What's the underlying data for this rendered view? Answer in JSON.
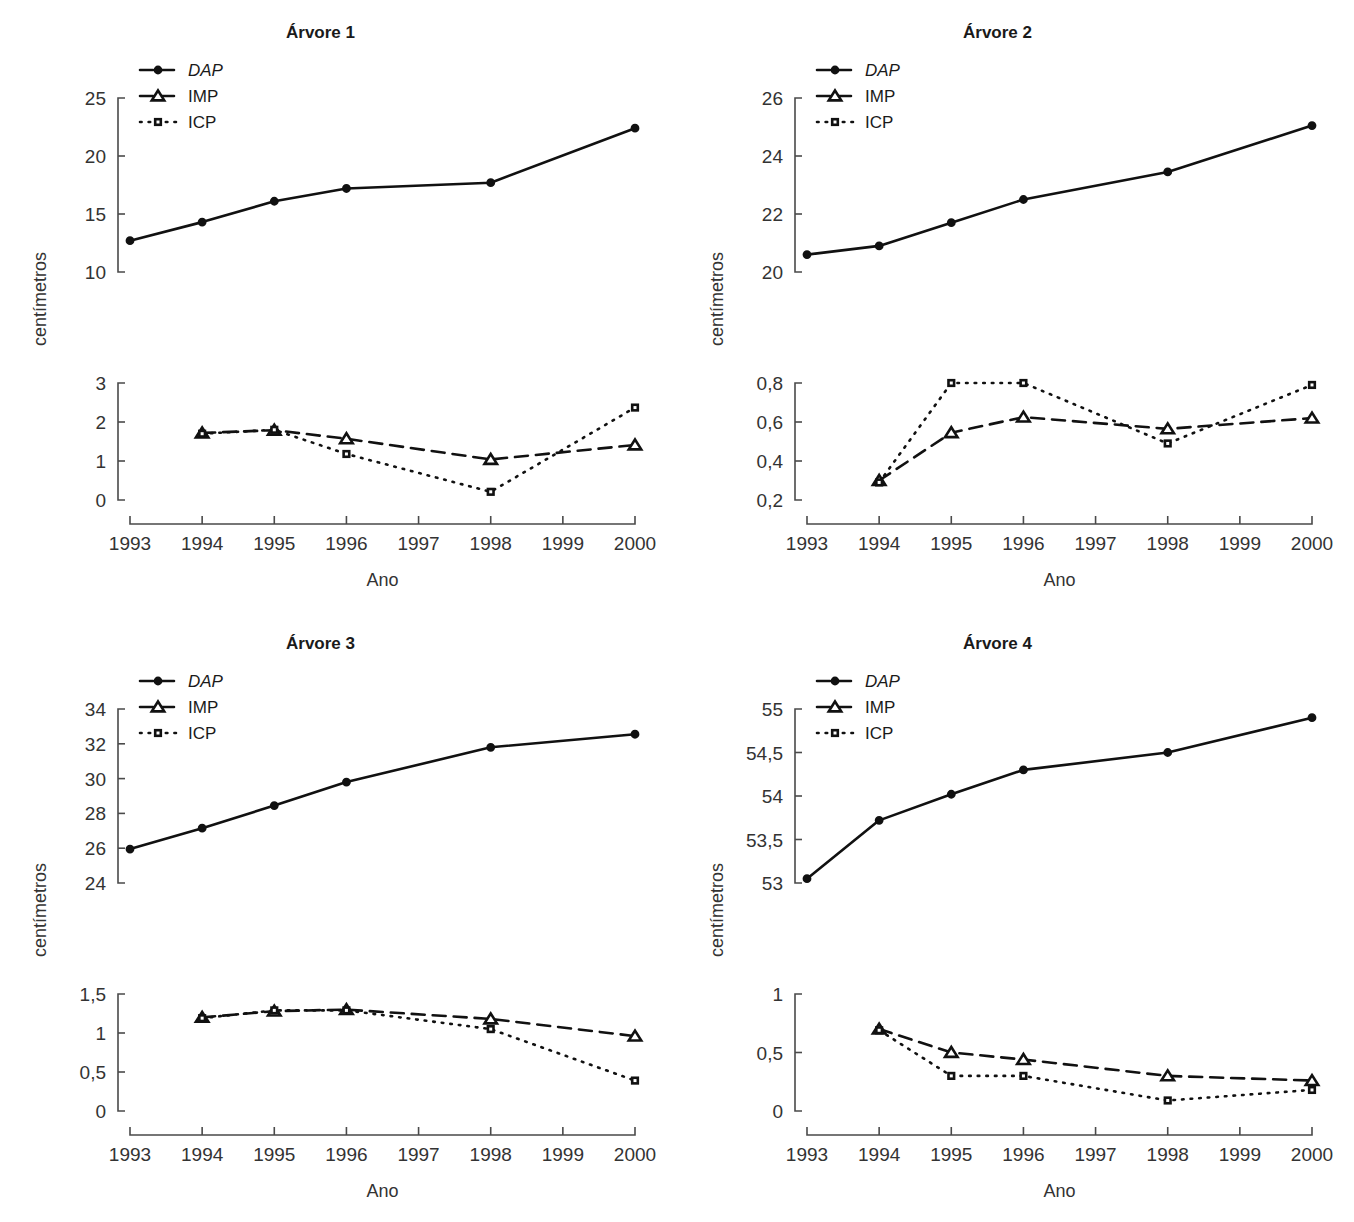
{
  "figure": {
    "panel_count": 4,
    "shared_ylabel": "centímetros",
    "shared_xlabel": "Ano",
    "legend_labels": [
      "DAP",
      "IMP",
      "ICP"
    ],
    "legend_styles": [
      "dashed-circle",
      "dashed-triangle",
      "dotted-square"
    ],
    "accent_color": "#111111",
    "axis_color": "#4a4a4a",
    "background": "#ffffff"
  },
  "chart_data": [
    {
      "type": "line",
      "title": "Árvore 1",
      "xlabel": "Ano",
      "ylabel": "centímetros",
      "grid": false,
      "legend_position": "top-left",
      "x": [
        1993,
        1994,
        1995,
        1996,
        1997,
        1998,
        1999,
        2000
      ],
      "xticklabels": [
        "1993",
        "1994",
        "1995",
        "1996",
        "1997",
        "1998",
        "1999",
        "2000"
      ],
      "xlim": [
        1993,
        2000
      ],
      "upper_panel": {
        "ylim": [
          10,
          25
        ],
        "yticks": [
          10,
          15,
          20,
          25
        ],
        "yticklabels": [
          "10",
          "15",
          "20",
          "25"
        ],
        "series": [
          {
            "name": "DAP",
            "x": [
              1993,
              1994,
              1995,
              1996,
              1998,
              2000
            ],
            "values": [
              12.7,
              14.3,
              16.1,
              17.2,
              17.7,
              22.4
            ]
          }
        ]
      },
      "lower_panel": {
        "ylim": [
          0,
          3
        ],
        "yticks": [
          0,
          1,
          2,
          3
        ],
        "yticklabels": [
          "0",
          "1",
          "2",
          "3"
        ],
        "series": [
          {
            "name": "IMP",
            "x": [
              1994,
              1995,
              1996,
              1998,
              2000
            ],
            "values": [
              1.72,
              1.79,
              1.57,
              1.04,
              1.41
            ]
          },
          {
            "name": "ICP",
            "x": [
              1994,
              1995,
              1996,
              1998,
              2000
            ],
            "values": [
              1.7,
              1.8,
              1.18,
              0.21,
              2.37
            ]
          }
        ]
      }
    },
    {
      "type": "line",
      "title": "Árvore 2",
      "xlabel": "Ano",
      "ylabel": "centímetros",
      "grid": false,
      "legend_position": "top-left",
      "x": [
        1993,
        1994,
        1995,
        1996,
        1997,
        1998,
        1999,
        2000
      ],
      "xticklabels": [
        "1993",
        "1994",
        "1995",
        "1996",
        "1997",
        "1998",
        "1999",
        "2000"
      ],
      "xlim": [
        1993,
        2000
      ],
      "upper_panel": {
        "ylim": [
          20,
          26
        ],
        "yticks": [
          20,
          22,
          24,
          26
        ],
        "yticklabels": [
          "20",
          "22",
          "24",
          "26"
        ],
        "series": [
          {
            "name": "DAP",
            "x": [
              1993,
              1994,
              1995,
              1996,
              1998,
              2000
            ],
            "values": [
              20.6,
              20.9,
              21.7,
              22.5,
              23.45,
              25.05
            ]
          }
        ]
      },
      "lower_panel": {
        "ylim": [
          0.2,
          0.8
        ],
        "yticks": [
          0.2,
          0.4,
          0.6,
          0.8
        ],
        "yticklabels": [
          "0,2",
          "0,4",
          "0,6",
          "0,8"
        ],
        "series": [
          {
            "name": "IMP",
            "x": [
              1994,
              1995,
              1996,
              1998,
              2000
            ],
            "values": [
              0.3,
              0.545,
              0.625,
              0.565,
              0.62
            ]
          },
          {
            "name": "ICP",
            "x": [
              1994,
              1995,
              1996,
              1998,
              2000
            ],
            "values": [
              0.29,
              0.8,
              0.8,
              0.49,
              0.79
            ]
          }
        ]
      }
    },
    {
      "type": "line",
      "title": "Árvore 3",
      "xlabel": "Ano",
      "ylabel": "centímetros",
      "grid": false,
      "legend_position": "top-left",
      "x": [
        1993,
        1994,
        1995,
        1996,
        1997,
        1998,
        1999,
        2000
      ],
      "xticklabels": [
        "1993",
        "1994",
        "1995",
        "1996",
        "1997",
        "1998",
        "1999",
        "2000"
      ],
      "xlim": [
        1993,
        2000
      ],
      "upper_panel": {
        "ylim": [
          24,
          34
        ],
        "yticks": [
          24,
          26,
          28,
          30,
          32,
          34
        ],
        "yticklabels": [
          "24",
          "26",
          "28",
          "30",
          "32",
          "34"
        ],
        "series": [
          {
            "name": "DAP",
            "x": [
              1993,
              1994,
              1995,
              1996,
              1998,
              2000
            ],
            "values": [
              25.95,
              27.15,
              28.45,
              29.8,
              31.8,
              32.55
            ]
          }
        ]
      },
      "lower_panel": {
        "ylim": [
          0,
          1.5
        ],
        "yticks": [
          0,
          0.5,
          1,
          1.5
        ],
        "yticklabels": [
          "0",
          "0,5",
          "1",
          "1,5"
        ],
        "series": [
          {
            "name": "IMP",
            "x": [
              1994,
              1995,
              1996,
              1998,
              2000
            ],
            "values": [
              1.2,
              1.28,
              1.3,
              1.18,
              0.96
            ]
          },
          {
            "name": "ICP",
            "x": [
              1994,
              1995,
              1996,
              1998,
              2000
            ],
            "values": [
              1.19,
              1.29,
              1.29,
              1.05,
              0.39
            ]
          }
        ]
      }
    },
    {
      "type": "line",
      "title": "Árvore 4",
      "xlabel": "Ano",
      "ylabel": "centímetros",
      "grid": false,
      "legend_position": "top-left",
      "x": [
        1993,
        1994,
        1995,
        1996,
        1997,
        1998,
        1999,
        2000
      ],
      "xticklabels": [
        "1993",
        "1994",
        "1995",
        "1996",
        "1997",
        "1998",
        "1999",
        "2000"
      ],
      "xlim": [
        1993,
        2000
      ],
      "upper_panel": {
        "ylim": [
          53,
          55
        ],
        "yticks": [
          53,
          53.5,
          54,
          54.5,
          55
        ],
        "yticklabels": [
          "53",
          "53,5",
          "54",
          "54,5",
          "55"
        ],
        "series": [
          {
            "name": "DAP",
            "x": [
              1993,
              1994,
              1995,
              1996,
              1998,
              2000
            ],
            "values": [
              53.05,
              53.72,
              54.02,
              54.3,
              54.5,
              54.9
            ]
          }
        ]
      },
      "lower_panel": {
        "ylim": [
          0,
          1
        ],
        "yticks": [
          0,
          0.5,
          1
        ],
        "yticklabels": [
          "0",
          "0,5",
          "1"
        ],
        "series": [
          {
            "name": "IMP",
            "x": [
              1994,
              1995,
              1996,
              1998,
              2000
            ],
            "values": [
              0.7,
              0.5,
              0.44,
              0.3,
              0.26
            ]
          },
          {
            "name": "ICP",
            "x": [
              1994,
              1995,
              1996,
              1998,
              2000
            ],
            "values": [
              0.69,
              0.3,
              0.3,
              0.09,
              0.18
            ]
          }
        ]
      }
    }
  ]
}
